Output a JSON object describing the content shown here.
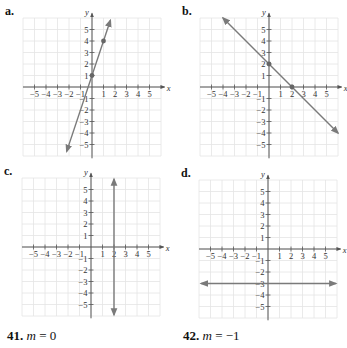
{
  "panels": [
    {
      "label": "a.",
      "line": {
        "type": "slope",
        "m": 3,
        "b": 1
      },
      "points": [
        [
          0,
          1
        ],
        [
          1,
          4
        ]
      ],
      "origin": [
        92,
        87
      ],
      "x_from": -2.2,
      "x_to": 1.6
    },
    {
      "label": "b.",
      "line": {
        "type": "slope",
        "m": -1,
        "b": 2
      },
      "points": [
        [
          0,
          2
        ],
        [
          2,
          0
        ]
      ],
      "origin": [
        269,
        87
      ],
      "x_from": -4,
      "x_to": 6
    },
    {
      "label": "c.",
      "line": {
        "type": "vertical",
        "x": 2
      },
      "points": [],
      "origin": [
        91,
        247
      ]
    },
    {
      "label": "d.",
      "line": {
        "type": "horizontal",
        "y": -3
      },
      "points": [],
      "origin": [
        268,
        249
      ]
    }
  ],
  "axes": {
    "x_label": "x",
    "y_label": "y",
    "x_ticks": [
      "−5",
      "−4",
      "−3",
      "−2",
      "−1",
      "1",
      "2",
      "3",
      "4",
      "5"
    ],
    "y_ticks": [
      "5",
      "4",
      "3",
      "2",
      "1",
      "−1",
      "−2",
      "−3",
      "−4",
      "−5"
    ]
  },
  "problems": [
    {
      "number": "41.",
      "var": "m",
      "equals": "=",
      "value": "0"
    },
    {
      "number": "42.",
      "var": "m",
      "equals": "=",
      "value": "−1"
    }
  ],
  "colors": {
    "grid": "#e4e4e4",
    "axis": "#555555",
    "line": "#7a7a7a",
    "point": "#666666"
  }
}
